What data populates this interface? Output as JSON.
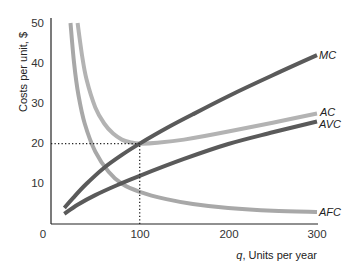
{
  "chart_data": {
    "type": "line",
    "title": "",
    "xlabel_var": "q",
    "xlabel": "q, Units per year",
    "xlabel_rest": ", Units per year",
    "ylabel": "Costs per unit, $",
    "xlim": [
      0,
      300
    ],
    "ylim": [
      0,
      50
    ],
    "x_ticks": [
      0,
      100,
      200,
      300
    ],
    "y_ticks": [
      10,
      20,
      30,
      40,
      50
    ],
    "grid": false,
    "legend": "inline labels at right end of curves",
    "series": [
      {
        "name": "MC",
        "color": "#5a5a5a",
        "points": [
          [
            15,
            4
          ],
          [
            25,
            6.5
          ],
          [
            40,
            10
          ],
          [
            60,
            14
          ],
          [
            80,
            17.2
          ],
          [
            100,
            20
          ],
          [
            130,
            23.8
          ],
          [
            160,
            27.3
          ],
          [
            200,
            31.8
          ],
          [
            250,
            37
          ],
          [
            300,
            42
          ]
        ]
      },
      {
        "name": "AC",
        "color": "#b3b3b3",
        "points": [
          [
            30,
            50
          ],
          [
            35,
            42
          ],
          [
            40,
            36
          ],
          [
            50,
            29
          ],
          [
            60,
            25
          ],
          [
            70,
            22.5
          ],
          [
            80,
            21
          ],
          [
            90,
            20.3
          ],
          [
            100,
            20
          ],
          [
            120,
            20.2
          ],
          [
            150,
            21
          ],
          [
            200,
            23
          ],
          [
            250,
            25.2
          ],
          [
            300,
            27.5
          ]
        ]
      },
      {
        "name": "AVC",
        "color": "#5a5a5a",
        "points": [
          [
            15,
            2.5
          ],
          [
            30,
            4.8
          ],
          [
            50,
            7.2
          ],
          [
            75,
            9.7
          ],
          [
            100,
            12
          ],
          [
            150,
            16.2
          ],
          [
            200,
            19.9
          ],
          [
            250,
            22.8
          ],
          [
            300,
            25.5
          ]
        ]
      },
      {
        "name": "AFC",
        "color": "#a8a8a8",
        "points": [
          [
            22,
            50
          ],
          [
            26,
            40
          ],
          [
            31,
            32
          ],
          [
            38,
            25
          ],
          [
            50,
            18
          ],
          [
            65,
            13
          ],
          [
            80,
            10
          ],
          [
            100,
            8
          ],
          [
            130,
            6.2
          ],
          [
            160,
            5
          ],
          [
            200,
            4
          ],
          [
            250,
            3.3
          ],
          [
            300,
            3
          ]
        ]
      }
    ],
    "annotations": [
      {
        "type": "dotted-line",
        "from": [
          0,
          20
        ],
        "to": [
          100,
          20
        ]
      },
      {
        "type": "dotted-line",
        "from": [
          100,
          0
        ],
        "to": [
          100,
          20
        ]
      }
    ]
  }
}
